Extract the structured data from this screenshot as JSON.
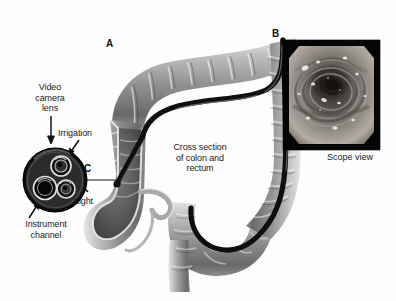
{
  "figure": {
    "background_color": "#fdfdfd",
    "text_color": "#1a1a1a"
  },
  "panels": [
    {
      "id": "A",
      "letter": "A",
      "description": "Cross section of colon and rectum with colonoscope inserted"
    },
    {
      "id": "B",
      "letter": "B",
      "description": "Endoscopic photograph of colon lumen"
    },
    {
      "id": "C",
      "letter": "C",
      "description": "Cross section of colonoscope tip"
    }
  ],
  "labels": {
    "panel_a": "A",
    "panel_b": "B",
    "panel_c": "C",
    "video_camera_lens": "Video\ncamera\nlens",
    "irrigation": "Irrigation",
    "light": "Light",
    "instrument_channel": "Instrument\nchannel",
    "cross_section": "Cross section\nof colon and\nrectum",
    "scope_view": "Scope view"
  },
  "scope_tip": {
    "ports": [
      {
        "name": "video-camera-lens",
        "label": "Video camera lens"
      },
      {
        "name": "irrigation-port",
        "label": "Irrigation"
      },
      {
        "name": "light-port",
        "label": "Light"
      },
      {
        "name": "instrument-channel-port",
        "label": "Instrument channel"
      }
    ],
    "body_color": "#2a2a2a"
  },
  "colors": {
    "tissue_light": "#cfcfcf",
    "tissue_mid": "#9a9a9a",
    "tissue_dark": "#5e5e5e",
    "scope_tube": "#141414",
    "photo_background": "#050505"
  }
}
